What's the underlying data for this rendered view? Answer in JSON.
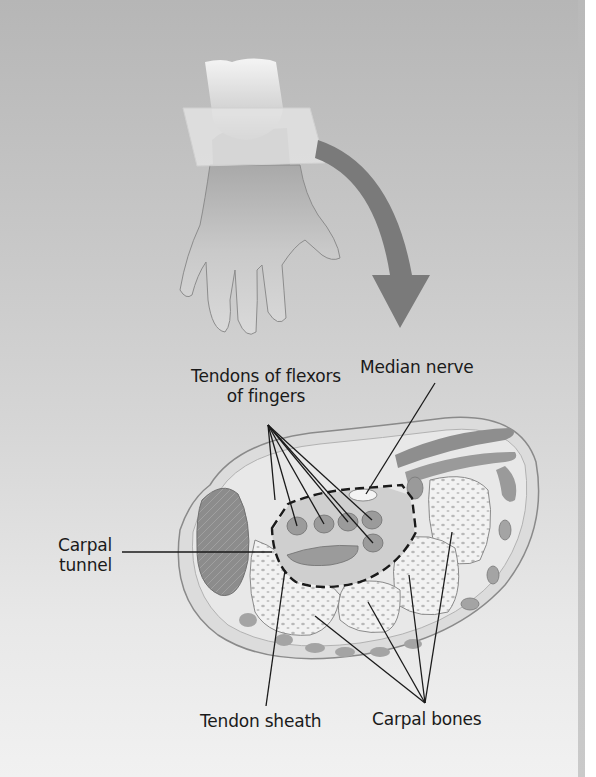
{
  "figure": {
    "labels": {
      "tendons_line1": "Tendons of flexors",
      "tendons_line2": "of fingers",
      "median_nerve": "Median nerve",
      "carpal_line1": "Carpal",
      "carpal_line2": "tunnel",
      "tendon_sheath": "Tendon sheath",
      "carpal_bones": "Carpal bones"
    },
    "colors": {
      "background_top": "#b6b6b6",
      "background_bottom": "#f1f1f1",
      "arrow": "#7a7a7a",
      "label_text": "#1a1a1a"
    }
  }
}
